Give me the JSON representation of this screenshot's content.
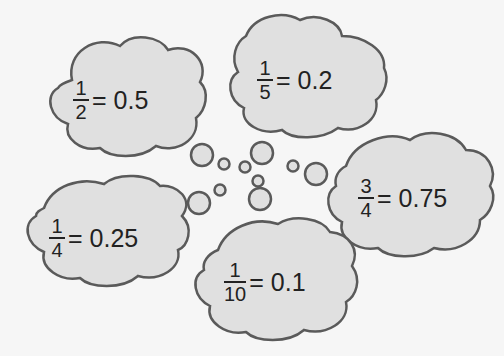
{
  "equations": [
    {
      "numerator": "1",
      "denominator": "2",
      "rhs": "= 0.5"
    },
    {
      "numerator": "1",
      "denominator": "5",
      "rhs": "= 0.2"
    },
    {
      "numerator": "3",
      "denominator": "4",
      "rhs": "= 0.75"
    },
    {
      "numerator": "1",
      "denominator": "4",
      "rhs": "= 0.25"
    },
    {
      "numerator": "1",
      "denominator": "10",
      "rhs": "= 0.1"
    }
  ],
  "colors": {
    "cloud_fill": "#e0e0e0",
    "cloud_stroke": "#5a5a5a",
    "background": "#f6f6f6"
  }
}
